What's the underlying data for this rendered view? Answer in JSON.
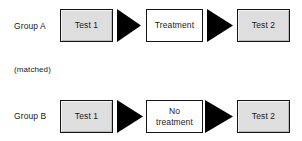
{
  "diagram": {
    "background_color": "#ffffff",
    "box_fill_color": "#dededf",
    "box_border_color": "#141414",
    "arrow_color": "#000000",
    "text_color": "#1a1a1a",
    "note": {
      "label": "(matched)"
    },
    "rows": [
      {
        "label": "Group A",
        "stages": [
          {
            "text": "Test 1",
            "style": "filled"
          },
          {
            "text": "Treatment",
            "style": "hollow"
          },
          {
            "text": "Test 2",
            "style": "filled"
          }
        ],
        "connectors": [
          {
            "name": "arrow-right-icon"
          },
          {
            "name": "arrow-right-icon"
          }
        ]
      },
      {
        "label": "Group B",
        "stages": [
          {
            "text": "Test 1",
            "style": "filled"
          },
          {
            "text": "No\ntreatment",
            "style": "hollow"
          },
          {
            "text": "Test 2",
            "style": "filled"
          }
        ],
        "connectors": [
          {
            "name": "arrow-right-icon"
          },
          {
            "name": "arrow-right-icon"
          }
        ]
      }
    ]
  }
}
